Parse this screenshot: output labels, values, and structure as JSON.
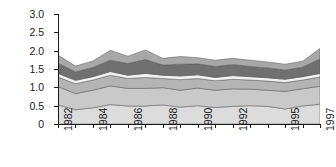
{
  "chart_data": {
    "type": "area",
    "title": "",
    "xlabel": "",
    "ylabel": "Summed regional NDVI",
    "ylim": [
      0,
      3.0
    ],
    "ytick_labels": [
      "3.0",
      "2.5",
      "2.0",
      "1.5",
      "1.0",
      "0.5",
      "0"
    ],
    "ytick_values": [
      3.0,
      2.5,
      2.0,
      1.5,
      1.0,
      0.5,
      0
    ],
    "grid": false,
    "legend_position": "none",
    "stacked": true,
    "x": [
      1982,
      1983,
      1984,
      1985,
      1986,
      1987,
      1988,
      1989,
      1990,
      1991,
      1992,
      1993,
      1994,
      1995,
      1996,
      1997
    ],
    "xtick_labels": [
      "1982",
      "1984",
      "1986",
      "1988",
      "1990",
      "1992",
      "1995",
      "1997"
    ],
    "xtick_label_years": [
      1982,
      1984,
      1986,
      1988,
      1990,
      1992,
      1995,
      1997
    ],
    "series": [
      {
        "name": "band-1",
        "color": "#dcdcdc",
        "values": [
          0.52,
          0.39,
          0.44,
          0.53,
          0.49,
          0.49,
          0.52,
          0.46,
          0.5,
          0.45,
          0.48,
          0.5,
          0.48,
          0.41,
          0.49,
          0.54
        ]
      },
      {
        "name": "band-2",
        "color": "#c9c9c9",
        "values": [
          0.5,
          0.44,
          0.48,
          0.51,
          0.48,
          0.48,
          0.47,
          0.46,
          0.48,
          0.47,
          0.48,
          0.45,
          0.44,
          0.48,
          0.47,
          0.49
        ]
      },
      {
        "name": "band-3",
        "color": "#b4b4b4",
        "values": [
          0.26,
          0.27,
          0.28,
          0.29,
          0.27,
          0.3,
          0.25,
          0.29,
          0.26,
          0.26,
          0.26,
          0.25,
          0.25,
          0.24,
          0.24,
          0.25
        ]
      },
      {
        "name": "band-4",
        "color": "#f2f2f2",
        "values": [
          0.1,
          0.09,
          0.09,
          0.1,
          0.09,
          0.11,
          0.09,
          0.1,
          0.1,
          0.09,
          0.1,
          0.09,
          0.09,
          0.09,
          0.09,
          0.1
        ]
      },
      {
        "name": "band-5",
        "color": "#707070",
        "values": [
          0.28,
          0.23,
          0.25,
          0.31,
          0.32,
          0.38,
          0.28,
          0.32,
          0.3,
          0.3,
          0.3,
          0.28,
          0.27,
          0.25,
          0.26,
          0.4
        ]
      },
      {
        "name": "band-6",
        "color": "#a8a8a8",
        "values": [
          0.22,
          0.16,
          0.18,
          0.27,
          0.2,
          0.26,
          0.18,
          0.21,
          0.17,
          0.17,
          0.17,
          0.17,
          0.16,
          0.16,
          0.16,
          0.28
        ]
      }
    ]
  },
  "axis": {
    "axis_color": "#1a1a1a"
  }
}
